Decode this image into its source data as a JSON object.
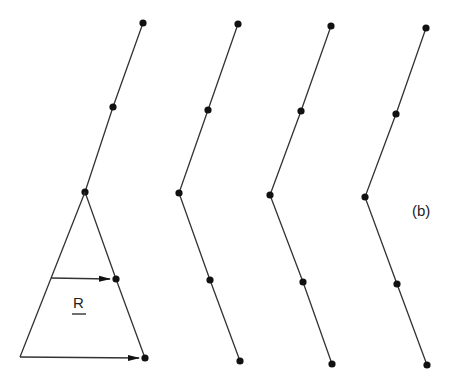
{
  "figure": {
    "panel_label": "(b)",
    "vector_label": "R",
    "colors": {
      "line": "#333333",
      "atom": "#111111",
      "background": "#ffffff"
    },
    "chains": [
      {
        "name": "chain-1",
        "points": [
          [
            143,
            23
          ],
          [
            113,
            107
          ],
          [
            85,
            192
          ],
          [
            116,
            279
          ],
          [
            145,
            358
          ]
        ]
      },
      {
        "name": "chain-2",
        "points": [
          [
            238,
            24
          ],
          [
            208,
            110
          ],
          [
            179,
            193
          ],
          [
            210,
            280
          ],
          [
            240,
            361
          ]
        ]
      },
      {
        "name": "chain-3",
        "points": [
          [
            331,
            26
          ],
          [
            301,
            111
          ],
          [
            270,
            195
          ],
          [
            303,
            282
          ],
          [
            332,
            364
          ]
        ]
      },
      {
        "name": "chain-4",
        "points": [
          [
            426,
            28
          ],
          [
            396,
            114
          ],
          [
            365,
            197
          ],
          [
            397,
            284
          ],
          [
            427,
            365
          ]
        ]
      }
    ],
    "triangle": {
      "apex": [
        85,
        192
      ],
      "left_base": [
        20,
        357
      ],
      "right_base": [
        145,
        358
      ]
    },
    "vectors": [
      {
        "name": "vector-R-mid",
        "from": [
          51,
          278
        ],
        "to": [
          110,
          279
        ]
      },
      {
        "name": "vector-base",
        "from": [
          20,
          357
        ],
        "to": [
          139,
          358
        ]
      }
    ]
  }
}
